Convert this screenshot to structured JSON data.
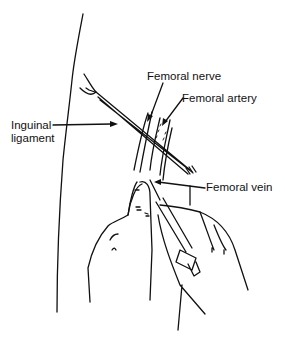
{
  "figure": {
    "line_color": "#111111",
    "background": "#ffffff"
  },
  "labels": {
    "femoral_nerve": "Femoral nerve",
    "femoral_artery": "Femoral artery",
    "inguinal_line1": "Inguinal",
    "inguinal_line2": "ligament",
    "femoral_vein": "Femoral vein"
  }
}
